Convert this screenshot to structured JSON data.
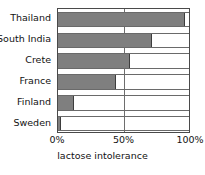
{
  "chart_data": {
    "type": "bar",
    "orientation": "horizontal",
    "title": "",
    "subtitle": "",
    "xlabel": "lactose intolerance",
    "ylabel": "",
    "categories": [
      "Thailand",
      "South India",
      "Crete",
      "France",
      "Finland",
      "Sweden"
    ],
    "values": [
      97,
      72,
      55,
      44,
      12,
      2
    ],
    "value_unit": "%",
    "xlim": [
      0,
      100
    ],
    "xticks": [
      0,
      50,
      100
    ],
    "xtick_labels": [
      "0%",
      "50%",
      "100%"
    ],
    "grid": "vertical-midline-only",
    "legend": "none",
    "series": [
      {
        "name": "lactose intolerance",
        "values": [
          97,
          72,
          55,
          44,
          12,
          2
        ]
      }
    ],
    "colors": {
      "bar_fill": "#7f7f7f",
      "bar_edge": "#3d3d3d",
      "axis": "#4a4a4a",
      "gridline": "#6e6e6e",
      "text": "#121212",
      "background": "#ffffff"
    }
  },
  "axis": {
    "x_title": "lactose intolerance",
    "tick_0": "0%",
    "tick_50": "50%",
    "tick_100": "100%"
  },
  "rows": [
    {
      "label": "Thailand",
      "value": 97
    },
    {
      "label": "South India",
      "value": 72
    },
    {
      "label": "Crete",
      "value": 55
    },
    {
      "label": "France",
      "value": 44
    },
    {
      "label": "Finland",
      "value": 12
    },
    {
      "label": "Sweden",
      "value": 2
    }
  ]
}
